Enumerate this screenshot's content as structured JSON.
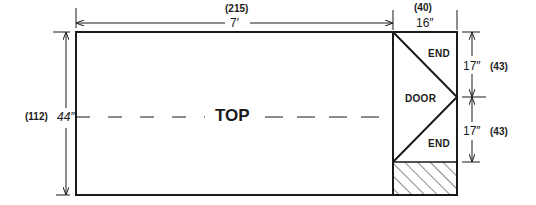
{
  "diagram": {
    "main_panel": {
      "label": "TOP"
    },
    "side_panel": {
      "upper_label": "END",
      "middle_label": "DOOR",
      "lower_label": "END"
    },
    "dimensions": {
      "width_main": {
        "imperial": "7′",
        "metric": "(215)"
      },
      "width_side": {
        "imperial": "16″",
        "metric": "(40)"
      },
      "height_total": {
        "imperial": "44″",
        "metric": "(112)"
      },
      "height_upper_end": {
        "imperial": "17″",
        "metric": "(43)"
      },
      "height_lower_end": {
        "imperial": "17″",
        "metric": "(43)"
      }
    },
    "colors": {
      "line": "#1a1a1a",
      "background": "#ffffff"
    }
  }
}
